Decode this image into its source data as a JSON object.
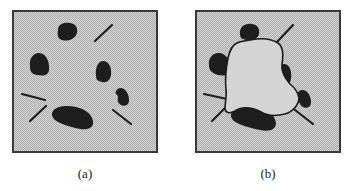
{
  "figure": {
    "panels": [
      {
        "id": "a",
        "caption": "(a)",
        "description": "Scattered dark blobs and short line segments on a dotted gray background"
      },
      {
        "id": "b",
        "caption": "(b)",
        "description": "Same blobs and segments with a closed contour wrapping around and touching them"
      }
    ],
    "colors": {
      "background_fill": "#cfcfcf",
      "dither": "#b4b4b4",
      "border": "#3a3a3a",
      "blob": "#1e1e1e",
      "contour": "#1a1a1a",
      "inner_region": "#d3d3d3"
    }
  }
}
